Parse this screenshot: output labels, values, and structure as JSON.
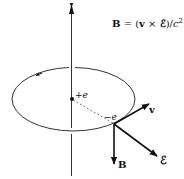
{
  "diagram": {
    "equation": {
      "lhs": "B",
      "eq": " = (",
      "v": "v",
      "times": " × ",
      "E": "ℰ",
      "close": ")/",
      "c": "c",
      "exp": "2"
    },
    "labels": {
      "plus_e": "+e",
      "minus_e": "−e",
      "v": "v",
      "E": "ℰ",
      "B": "B"
    },
    "colors": {
      "line": "#222222",
      "background": "#ffffff"
    }
  }
}
